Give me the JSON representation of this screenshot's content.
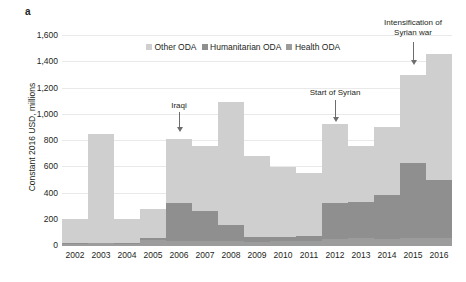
{
  "panel": {
    "label": "a"
  },
  "legend": {
    "position": "top-center",
    "items": [
      {
        "label": "Other ODA",
        "color": "#cfcfcf",
        "icon": "legend-swatch-icon"
      },
      {
        "label": "Humanitarian ODA",
        "color": "#8f8f8f",
        "icon": "legend-swatch-icon"
      },
      {
        "label": "Health ODA",
        "color": "#9c9c9c",
        "icon": "legend-swatch-icon"
      }
    ]
  },
  "annotations": [
    {
      "text": "Iraqi",
      "year": "2006"
    },
    {
      "text": "Start of Syrian",
      "year": "2012"
    },
    {
      "text": "Intensification of\nSyrian war",
      "year": "2015"
    }
  ],
  "chart_data": {
    "type": "bar",
    "stacked": true,
    "title": "",
    "xlabel": "",
    "ylabel": "Constant 2016 USD, millions",
    "ylim": [
      0,
      1600
    ],
    "yticks": [
      "0",
      "200",
      "400",
      "600",
      "800",
      "1,000",
      "1,200",
      "1,400",
      "1,600"
    ],
    "grid": true,
    "categories": [
      "2002",
      "2003",
      "2004",
      "2005",
      "2006",
      "2007",
      "2008",
      "2009",
      "2010",
      "2011",
      "2012",
      "2013",
      "2014",
      "2015",
      "2016"
    ],
    "series": [
      {
        "name": "Health ODA",
        "color": "#9c9c9c",
        "values": [
          15,
          20,
          15,
          45,
          40,
          35,
          35,
          30,
          35,
          40,
          55,
          60,
          55,
          60,
          60
        ]
      },
      {
        "name": "Humanitarian ODA",
        "color": "#8f8f8f",
        "values": [
          5,
          5,
          5,
          15,
          285,
          230,
          125,
          35,
          35,
          40,
          275,
          275,
          330,
          570,
          440
        ]
      },
      {
        "name": "Other ODA",
        "color": "#cfcfcf",
        "values": [
          185,
          830,
          185,
          225,
          490,
          500,
          940,
          620,
          530,
          475,
          600,
          430,
          525,
          675,
          960
        ]
      }
    ],
    "totals": [
      205,
      855,
      205,
      285,
      815,
      765,
      1100,
      685,
      600,
      555,
      930,
      765,
      910,
      1305,
      1460
    ]
  }
}
